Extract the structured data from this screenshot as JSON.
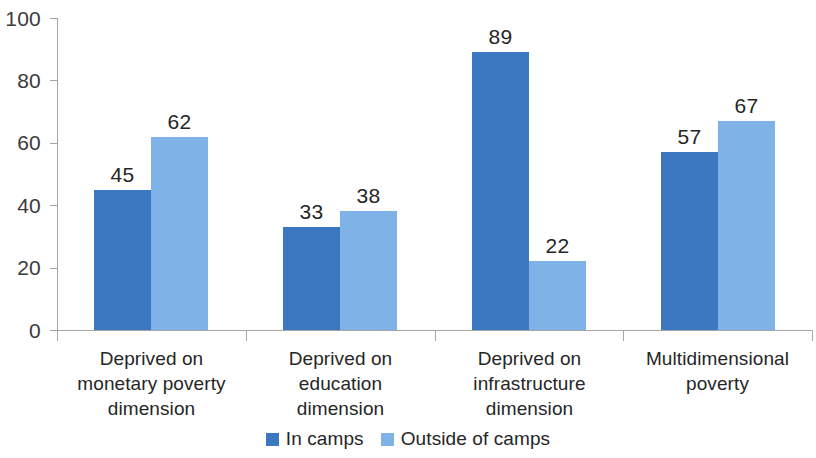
{
  "chart_data": {
    "type": "bar",
    "title": "",
    "subtitle": "",
    "xlabel": "",
    "ylabel": "",
    "ylim": [
      0,
      100
    ],
    "y_ticks": [
      0,
      20,
      40,
      60,
      80,
      100
    ],
    "grid": false,
    "legend_position": "bottom",
    "categories": [
      "Deprived on monetary poverty dimension",
      "Deprived on education dimension",
      "Deprived on infrastructure dimension",
      "Multidimensional poverty"
    ],
    "category_lines": [
      [
        "Deprived on",
        "monetary poverty",
        "dimension"
      ],
      [
        "Deprived on",
        "education",
        "dimension"
      ],
      [
        "Deprived on",
        "infrastructure",
        "dimension"
      ],
      [
        "Multidimensional",
        "poverty"
      ]
    ],
    "series": [
      {
        "name": "In camps",
        "color": "#3c78c2",
        "values": [
          45,
          33,
          89,
          57
        ]
      },
      {
        "name": "Outside of camps",
        "color": "#7fb3e8",
        "values": [
          62,
          38,
          22,
          67
        ]
      }
    ]
  },
  "axis": {
    "y_tick_labels": [
      "0",
      "20",
      "40",
      "60",
      "80",
      "100"
    ]
  },
  "legend": {
    "items": [
      {
        "label": "In camps"
      },
      {
        "label": "Outside of camps"
      }
    ]
  },
  "colors": {
    "series_in_camps": "#3c78c2",
    "series_outside_camps": "#7fb3e8",
    "axis": "#a6a6a6",
    "text": "#262626",
    "background": "#ffffff"
  }
}
